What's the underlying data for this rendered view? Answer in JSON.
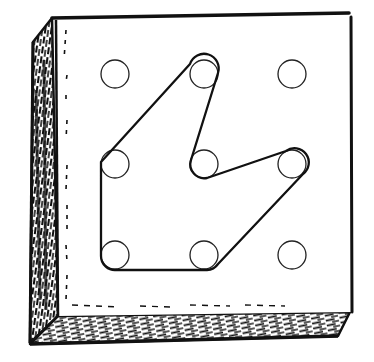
{
  "figure": {
    "description": "Geoboard with a 3x3 grid of pegs and a rubber band stretched around seven pegs forming a shape",
    "colors": {
      "ink": "#111111",
      "paper": "#ffffff"
    },
    "pegs": [
      {
        "row": 0,
        "col": 0,
        "cx": 115,
        "cy": 74
      },
      {
        "row": 0,
        "col": 1,
        "cx": 204,
        "cy": 74
      },
      {
        "row": 0,
        "col": 2,
        "cx": 292,
        "cy": 74
      },
      {
        "row": 1,
        "col": 0,
        "cx": 115,
        "cy": 164
      },
      {
        "row": 1,
        "col": 1,
        "cx": 204,
        "cy": 164
      },
      {
        "row": 1,
        "col": 2,
        "cx": 292,
        "cy": 164
      },
      {
        "row": 2,
        "col": 0,
        "cx": 115,
        "cy": 255
      },
      {
        "row": 2,
        "col": 1,
        "cx": 204,
        "cy": 255
      },
      {
        "row": 2,
        "col": 2,
        "cx": 292,
        "cy": 255
      }
    ],
    "band_pegs": [
      "r0c1",
      "r1c1",
      "r1c2",
      "r2c1",
      "r2c0",
      "r1c0"
    ]
  }
}
